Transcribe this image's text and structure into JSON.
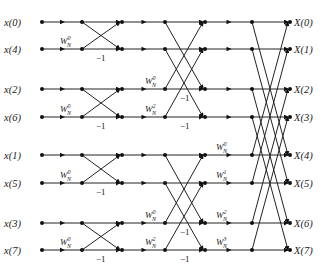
{
  "inputs": [
    "x(0)",
    "x(4)",
    "x(2)",
    "x(6)",
    "x(1)",
    "x(5)",
    "x(3)",
    "x(7)"
  ],
  "outputs": [
    "X(0)",
    "X(1)",
    "X(2)",
    "X(3)",
    "X(4)",
    "X(5)",
    "X(6)",
    "X(7)"
  ],
  "rows_y": [
    22,
    49,
    89,
    117,
    155,
    183,
    223,
    250
  ],
  "columns_x": [
    42,
    82,
    122,
    165,
    205,
    252,
    290
  ],
  "stage1": {
    "twiddle_labels": [
      {
        "base": "W",
        "sub": "N",
        "sup": "0",
        "row": 1
      },
      {
        "base": "W",
        "sub": "N",
        "sup": "0",
        "row": 3
      },
      {
        "base": "W",
        "sub": "N",
        "sup": "0",
        "row": 5
      },
      {
        "base": "W",
        "sub": "N",
        "sup": "0",
        "row": 7
      }
    ],
    "negation_label": "−1"
  },
  "stage2": {
    "twiddle_labels": [
      {
        "base": "W",
        "sub": "N",
        "sup": "0",
        "row": 2
      },
      {
        "base": "W",
        "sub": "N",
        "sup": "2",
        "row": 3
      },
      {
        "base": "W",
        "sub": "N",
        "sup": "0",
        "row": 6
      },
      {
        "base": "W",
        "sub": "N",
        "sup": "2",
        "row": 7
      }
    ],
    "negation_label": "−1"
  },
  "stage3": {
    "twiddle_labels": [
      {
        "base": "W",
        "sub": "N",
        "sup": "0",
        "row": 4
      },
      {
        "base": "W",
        "sub": "N",
        "sup": "1",
        "row": 5
      },
      {
        "base": "W",
        "sub": "N",
        "sup": "2",
        "row": 6
      },
      {
        "base": "W",
        "sub": "N",
        "sup": "3",
        "row": 7
      }
    ],
    "negation_label": "−1"
  },
  "colors": {
    "line": "#222222",
    "node": "#111111",
    "background": "#ffffff"
  }
}
